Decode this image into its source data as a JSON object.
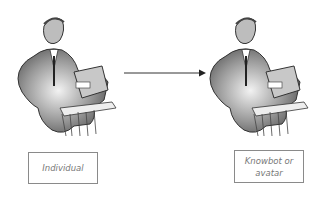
{
  "diagram": {
    "nodes": [
      {
        "id": "individual",
        "label": "Individual",
        "icon": "woman-at-desk-clipart-icon"
      },
      {
        "id": "knowbot",
        "label_line1": "Knowbot or",
        "label_line2": "avatar",
        "icon": "woman-at-desk-clipart-icon"
      }
    ],
    "edges": [
      {
        "from": "individual",
        "to": "knowbot",
        "style": "solid-arrow"
      }
    ],
    "colors": {
      "line": "#333333",
      "box_border": "#8a8a8a",
      "label_text": "#777777"
    }
  }
}
